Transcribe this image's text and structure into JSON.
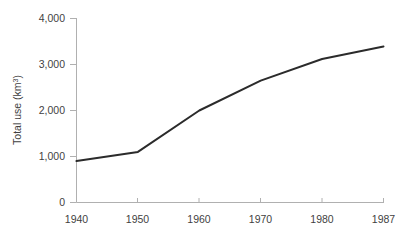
{
  "chart_data": {
    "type": "line",
    "title": "",
    "subtitle": "",
    "xlabel": "",
    "ylabel": "Total use (km³)",
    "ylabel_base": "Total use (km",
    "ylabel_sup": "3",
    "ylabel_close": ")",
    "x": [
      1940,
      1950,
      1960,
      1970,
      1980,
      1987
    ],
    "categories": [
      "1940",
      "1950",
      "1960",
      "1970",
      "1980",
      "1987"
    ],
    "values": [
      900,
      1100,
      2000,
      2650,
      3120,
      3390
    ],
    "series": [
      {
        "name": "Total use",
        "values": [
          900,
          1100,
          2000,
          2650,
          3120,
          3390
        ]
      }
    ],
    "ylim": [
      0,
      4000
    ],
    "yticks": [
      0,
      1000,
      2000,
      3000,
      4000
    ],
    "ytick_labels": [
      "0",
      "1,000",
      "2,000",
      "3,000",
      "4,000"
    ],
    "xticks": [
      1940,
      1950,
      1960,
      1970,
      1980,
      1987
    ],
    "xtick_labels": [
      "1940",
      "1950",
      "1960",
      "1970",
      "1980",
      "1987"
    ],
    "grid": false,
    "legend": false,
    "legend_position": "none",
    "line_color": "#2b2b2b",
    "axis_color": "#b0b0b0",
    "text_color": "#3f3f3f",
    "background_color": "#ffffff",
    "annotations": []
  },
  "axis": {
    "y_tick_labels": [
      "4,000",
      "3,000",
      "2,000",
      "1,000",
      "0"
    ],
    "x_tick_labels": [
      "1940",
      "1950",
      "1960",
      "1970",
      "1980",
      "1987"
    ]
  }
}
